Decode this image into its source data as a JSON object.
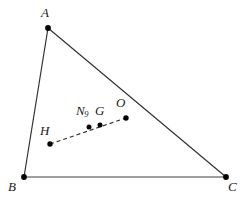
{
  "figure": {
    "type": "euler-line-triangle",
    "width": 247,
    "height": 201,
    "background": "#ffffff",
    "colors": {
      "side_dark": "#333333",
      "side_base": "#808080",
      "euler_line": "#2b2b2b",
      "point_fill": "#000000",
      "label": "#1a1a1a"
    }
  },
  "vertices": [
    {
      "name": "A",
      "label": "A",
      "x": 48,
      "y": 28,
      "label_x": 41,
      "label_y": 6
    },
    {
      "name": "B",
      "label": "B",
      "x": 24,
      "y": 177,
      "label_x": 8,
      "label_y": 180
    },
    {
      "name": "C",
      "label": "C",
      "x": 226,
      "y": 177,
      "label_x": 228,
      "label_y": 180
    }
  ],
  "centers": [
    {
      "name": "H",
      "label": "H",
      "description": "orthocenter",
      "x": 50,
      "y": 144,
      "label_x": 40,
      "label_y": 124
    },
    {
      "name": "N9",
      "label": "N",
      "subscript": "9",
      "description": "nine-point-center",
      "x": 89,
      "y": 127,
      "label_x": 76,
      "label_y": 104
    },
    {
      "name": "G",
      "label": "G",
      "description": "centroid",
      "x": 100,
      "y": 125,
      "label_x": 95,
      "label_y": 104
    },
    {
      "name": "O",
      "label": "O",
      "description": "circumcenter",
      "x": 126,
      "y": 118,
      "label_x": 116,
      "label_y": 96
    }
  ],
  "sides": [
    {
      "name": "AB",
      "from": "A",
      "to": "B",
      "style": "solid",
      "color": "#333333"
    },
    {
      "name": "AC",
      "from": "A",
      "to": "C",
      "style": "solid",
      "color": "#333333"
    },
    {
      "name": "BC",
      "from": "B",
      "to": "C",
      "style": "solid",
      "color": "#808080"
    }
  ],
  "euler_line": {
    "name": "euler-line",
    "style": "dashed",
    "from": "H",
    "to": "O",
    "passes_through": [
      "H",
      "N9",
      "G",
      "O"
    ],
    "color": "#2b2b2b",
    "dash": "4 3"
  }
}
